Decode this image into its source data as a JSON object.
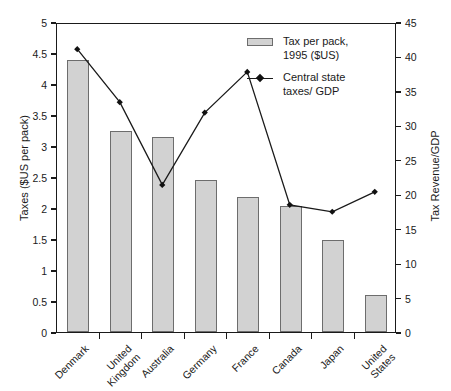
{
  "chart_data": {
    "type": "bar",
    "title": "",
    "categories": [
      "Denmark",
      "United Kingdom",
      "Australia",
      "Germany",
      "France",
      "Canada",
      "Japan",
      "United States"
    ],
    "series": [
      {
        "name": "Tax per pack, 1995 ($US)",
        "type": "bar",
        "axis": "left",
        "values": [
          4.38,
          3.24,
          3.15,
          2.45,
          2.18,
          2.03,
          1.48,
          0.6
        ]
      },
      {
        "name": "Central state taxes/ GDP",
        "type": "line",
        "axis": "right",
        "values": [
          41.2,
          33.5,
          21.5,
          32.0,
          37.9,
          18.6,
          17.6,
          20.5
        ]
      }
    ],
    "xlabel": "",
    "ylabel": "Taxes ($US per pack)",
    "y2label": "Tax Revenue/GDP",
    "ylim": [
      0,
      5
    ],
    "y2lim": [
      0,
      45
    ],
    "yticks": [
      "0",
      "0.5",
      "1",
      "1.5",
      "2",
      "2.5",
      "3",
      "3.5",
      "4",
      "4.5",
      "5"
    ],
    "y2ticks": [
      "0",
      "5",
      "10",
      "15",
      "20",
      "25",
      "30",
      "35",
      "40",
      "45"
    ],
    "grid": false,
    "legend_position": "top-right",
    "legend": [
      {
        "label": "Tax per pack,\n1995 ($US)",
        "marker": "bar-swatch",
        "color": "#d2d2d2"
      },
      {
        "label": "Central state\ntaxes/ GDP",
        "marker": "line-diamond",
        "color": "#1a1a1a"
      }
    ]
  },
  "colors": {
    "bar_fill": "#d2d2d2",
    "bar_stroke": "#6d6d6d",
    "line": "#1a1a1a",
    "axis": "#1a1a1a",
    "background": "#ffffff"
  }
}
